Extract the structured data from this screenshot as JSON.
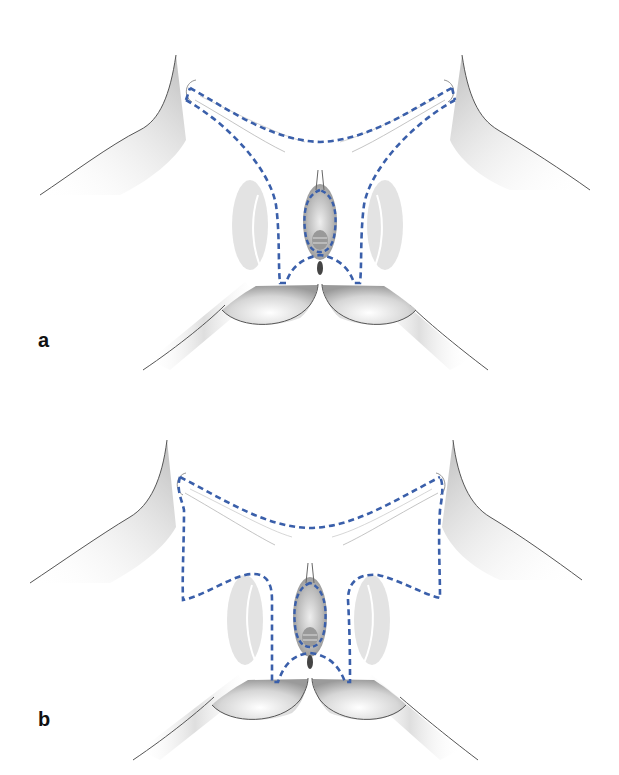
{
  "figure": {
    "panels": [
      {
        "label": "a",
        "description": "Anatomical illustration with dashed incision outline (narrow lateral flaps)"
      },
      {
        "label": "b",
        "description": "Anatomical illustration with dashed incision outline (wide lateral extensions)"
      }
    ],
    "colors": {
      "incision_dash": "#3a5faa",
      "contour": "#555555",
      "shading": "#9a9a9a",
      "background": "#ffffff"
    }
  }
}
